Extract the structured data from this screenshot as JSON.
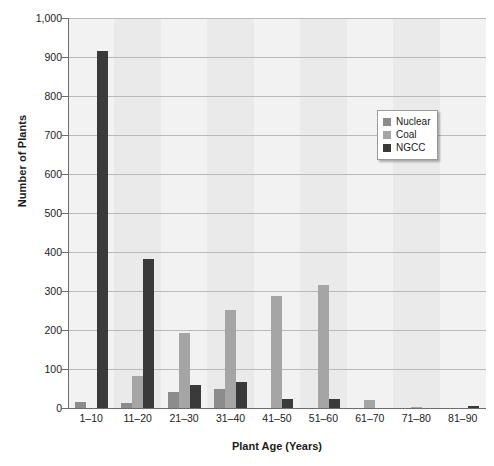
{
  "chart_data": {
    "type": "bar",
    "title": "",
    "xlabel": "Plant Age (Years)",
    "ylabel": "Number of Plants",
    "categories": [
      "1–10",
      "11–20",
      "21–30",
      "31–40",
      "41–50",
      "51–60",
      "61–70",
      "71–80",
      "81–90"
    ],
    "series": [
      {
        "name": "Nuclear",
        "color": "#8c8c8c",
        "values": [
          15,
          12,
          40,
          50,
          0,
          0,
          0,
          0,
          0
        ]
      },
      {
        "name": "Coal",
        "color": "#a5a5a5",
        "values": [
          0,
          83,
          192,
          252,
          288,
          315,
          20,
          2,
          0
        ]
      },
      {
        "name": "NGCC",
        "color": "#3a3a3a",
        "values": [
          915,
          383,
          58,
          66,
          24,
          23,
          0,
          0,
          4
        ]
      }
    ],
    "ylim": [
      0,
      1000
    ],
    "ytick_step": 100,
    "ytick_labels": [
      "1,000",
      "900",
      "800",
      "700",
      "600",
      "500",
      "400",
      "300",
      "200",
      "100",
      "0"
    ],
    "ytick_values": [
      1000,
      900,
      800,
      700,
      600,
      500,
      400,
      300,
      200,
      100,
      0
    ],
    "grid": "horizontal",
    "legend_position": "upper-right",
    "background_bands": "alternating-vertical"
  }
}
